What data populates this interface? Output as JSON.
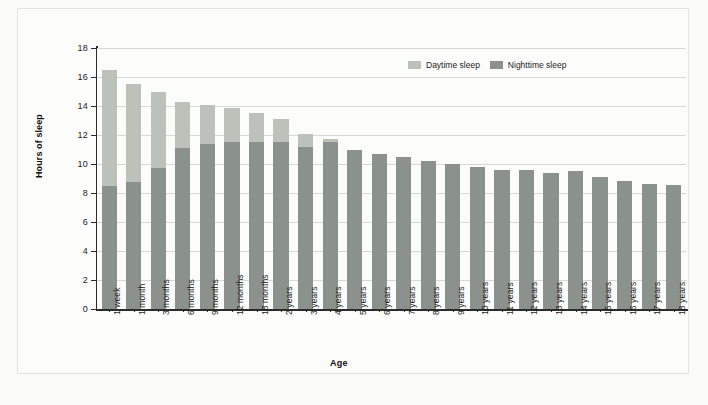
{
  "chart_data": {
    "type": "bar",
    "title": "",
    "xlabel": "Age",
    "ylabel": "Hours of sleep",
    "ylim": [
      0,
      18
    ],
    "ytick_labels": [
      "0",
      "2",
      "4",
      "6",
      "8",
      "10",
      "12",
      "14",
      "16",
      "18"
    ],
    "yticks": [
      0,
      2,
      4,
      6,
      8,
      10,
      12,
      14,
      16,
      18
    ],
    "grid": true,
    "stacked": true,
    "legend_position": "top-right",
    "categories": [
      "1 week",
      "1 month",
      "3 months",
      "6 months",
      "9 months",
      "12 months",
      "18 months",
      "2 years",
      "3 years",
      "4 years",
      "5 years",
      "6 years",
      "7 years",
      "8 years",
      "9 years",
      "10 years",
      "11 years",
      "12 years",
      "13 years",
      "14 years",
      "15 years",
      "16 years",
      "17 years",
      "18 years"
    ],
    "series": [
      {
        "name": "Nighttime sleep",
        "color": "#8b918c",
        "values": [
          8.5,
          8.75,
          9.75,
          11.1,
          11.35,
          11.5,
          11.5,
          11.5,
          11.2,
          11.5,
          11.0,
          10.7,
          10.5,
          10.2,
          10.0,
          9.8,
          9.6,
          9.6,
          9.4,
          9.5,
          9.1,
          8.8,
          8.6,
          8.55
        ]
      },
      {
        "name": "Daytime sleep",
        "color": "#bcc2b9",
        "values": [
          8.0,
          6.75,
          5.25,
          3.15,
          2.75,
          2.35,
          2.05,
          1.6,
          0.9,
          0.2,
          0,
          0,
          0,
          0,
          0,
          0,
          0,
          0,
          0,
          0,
          0,
          0,
          0,
          0
        ]
      }
    ],
    "totals": [
      16.5,
      15.5,
      15.0,
      14.25,
      14.1,
      13.85,
      13.55,
      13.1,
      12.1,
      11.7,
      11.0,
      10.7,
      10.5,
      10.2,
      10.0,
      9.8,
      9.6,
      9.6,
      9.4,
      9.5,
      9.1,
      8.8,
      8.6,
      8.55
    ]
  },
  "legend": {
    "daytime_label": "Daytime sleep",
    "nighttime_label": "Nighttime sleep"
  },
  "colors": {
    "daytime": "#bcc2b9",
    "nighttime": "#8b918c",
    "axis": "#2b2b2b",
    "grid": "#d6d8d3",
    "background": "#fcfcfb"
  }
}
